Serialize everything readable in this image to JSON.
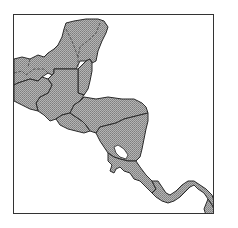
{
  "map": {
    "region": "Central America",
    "style": {
      "land_fill": "#a9a9a9",
      "hatch_color": "#7a7a7a",
      "border_color": "#2a2a2a",
      "water_color": "#ffffff",
      "frame_color": "#333333"
    },
    "countries": [
      {
        "id": "mexico-yucatan"
      },
      {
        "id": "guatemala"
      },
      {
        "id": "belize"
      },
      {
        "id": "el-salvador"
      },
      {
        "id": "honduras"
      },
      {
        "id": "nicaragua"
      },
      {
        "id": "costa-rica"
      },
      {
        "id": "panama"
      },
      {
        "id": "colombia-edge"
      }
    ],
    "lakes": [
      {
        "id": "lake-nicaragua"
      }
    ]
  }
}
